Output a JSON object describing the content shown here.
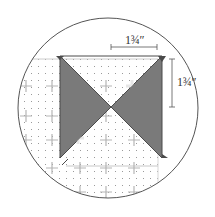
{
  "diagram": {
    "type": "quilting-ruler-detail",
    "labels": {
      "width_dimension": "1¾″",
      "height_dimension": "1¾″"
    },
    "colors": {
      "background": "#ffffff",
      "circle_outline": "#555555",
      "triangle_fill": "#7a7a7a",
      "triangle_edge": "#4a4a4a",
      "grid_dot": "#9a9a9a",
      "grid_cross": "#b0b0b0",
      "light_cross": "#e6e6e6",
      "dimension_line": "#555555"
    },
    "icons": [
      "hourglass-block-icon",
      "dimension-arrow-icon"
    ]
  }
}
